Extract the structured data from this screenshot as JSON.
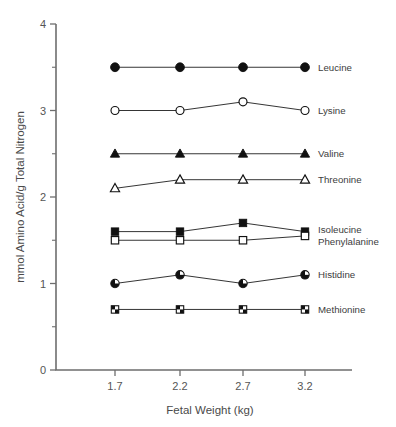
{
  "chart_data": {
    "type": "line",
    "title": "",
    "xlabel": "Fetal Weight (kg)",
    "ylabel": "mmol Amino Acid/g Total Nitrogen",
    "x": [
      1.7,
      2.2,
      2.7,
      3.2
    ],
    "categories": [
      "1.7",
      "2.2",
      "2.7",
      "3.2"
    ],
    "xtick_labels": [
      "1.7",
      "2.2",
      "2.7",
      "3.2"
    ],
    "ytick_labels": [
      "0",
      "1",
      "2",
      "3",
      "4"
    ],
    "yticks": [
      0,
      1,
      2,
      3,
      4
    ],
    "yminor_ticks": [
      0.5,
      1.5,
      2.5,
      3.5
    ],
    "ylim": [
      0,
      4
    ],
    "grid": false,
    "legend_position": "right-inline-at-last-point",
    "series": [
      {
        "name": "Leucine",
        "values": [
          3.5,
          3.5,
          3.5,
          3.5
        ],
        "marker": "filled-circle",
        "label": "Leucine"
      },
      {
        "name": "Lysine",
        "values": [
          3.0,
          3.0,
          3.1,
          3.0
        ],
        "marker": "open-circle",
        "label": "Lysine"
      },
      {
        "name": "Valine",
        "values": [
          2.5,
          2.5,
          2.5,
          2.5
        ],
        "marker": "filled-triangle",
        "label": "Valine"
      },
      {
        "name": "Threonine",
        "values": [
          2.1,
          2.2,
          2.2,
          2.2
        ],
        "marker": "open-triangle",
        "label": "Threonine"
      },
      {
        "name": "Isoleucine",
        "values": [
          1.6,
          1.6,
          1.7,
          1.6
        ],
        "marker": "filled-square",
        "label": "Isoleucine"
      },
      {
        "name": "Phenylalanine",
        "values": [
          1.5,
          1.5,
          1.5,
          1.55
        ],
        "marker": "open-square",
        "label": "Phenylalanine"
      },
      {
        "name": "Histidine",
        "values": [
          1.0,
          1.1,
          1.0,
          1.1
        ],
        "marker": "half-circle",
        "label": "Histidine"
      },
      {
        "name": "Methionine",
        "values": [
          0.7,
          0.7,
          0.7,
          0.7
        ],
        "marker": "half-square",
        "label": "Methionine"
      }
    ]
  }
}
